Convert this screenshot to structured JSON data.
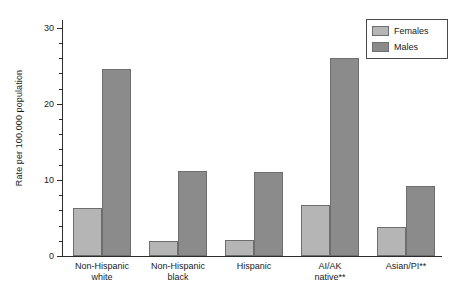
{
  "chart_data": {
    "type": "bar",
    "title": "",
    "subtitle": "",
    "xlabel": "",
    "ylabel": "Rate per 100,000 population",
    "ylim": [
      0,
      31
    ],
    "yticks": [
      0,
      10,
      20,
      30
    ],
    "ytick_labels": [
      "0",
      "10",
      "20",
      "30"
    ],
    "yminor_step": 2,
    "grid": false,
    "legend_position": "top-right",
    "categories": [
      "Non-Hispanic\nwhite",
      "Non-Hispanic\nblack",
      "Hispanic",
      "AI/AK\nnative**",
      "Asian/PI**"
    ],
    "series": [
      {
        "name": "Females",
        "color": "#b5b5b5",
        "values": [
          6.3,
          2.0,
          2.1,
          6.7,
          3.8
        ]
      },
      {
        "name": "Males",
        "color": "#8b8b8b",
        "values": [
          24.6,
          11.2,
          11.0,
          26.0,
          9.2
        ]
      }
    ]
  },
  "legend": {
    "items": [
      {
        "label": "Females",
        "color": "#b5b5b5"
      },
      {
        "label": "Males",
        "color": "#8b8b8b"
      }
    ]
  },
  "axes": {
    "y_title": "Rate per 100,000 population"
  }
}
